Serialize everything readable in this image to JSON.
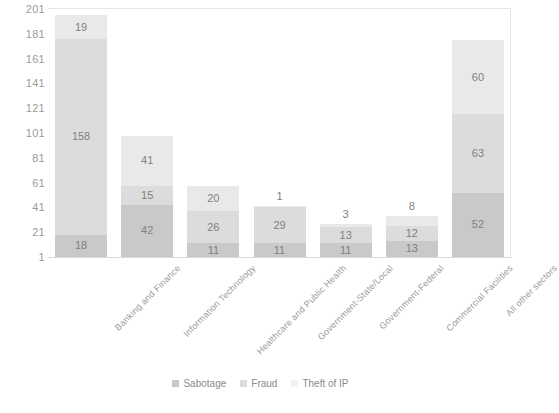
{
  "chart_data": {
    "type": "bar",
    "subtype": "stacked-bar",
    "title": "",
    "xlabel": "",
    "ylabel": "",
    "ylim": [
      1,
      201
    ],
    "ytick_step": 20,
    "yticks": [
      201,
      181,
      161,
      141,
      121,
      101,
      81,
      61,
      41,
      21,
      1
    ],
    "grid": false,
    "legend_position": "bottom",
    "categories": [
      "Banking and Finance",
      "Information Technology",
      "Healthcare and Public Health",
      "Government-State/Local",
      "Government-Federal",
      "Commercial Facilities",
      "All other sectors"
    ],
    "series": [
      {
        "name": "Sabotage",
        "color": "#c9c9c9",
        "values": [
          18,
          42,
          11,
          11,
          11,
          13,
          52
        ]
      },
      {
        "name": "Fraud",
        "color": "#dcdcdc",
        "values": [
          158,
          15,
          26,
          29,
          13,
          12,
          63
        ]
      },
      {
        "name": "Theft of IP",
        "color": "#f2f2f2",
        "values": [
          19,
          41,
          20,
          1,
          3,
          8,
          60
        ]
      }
    ]
  },
  "legend": {
    "items": [
      {
        "label": "Sabotage",
        "swatch": "sabotage-swatch"
      },
      {
        "label": "Fraud",
        "swatch": "fraud-swatch"
      },
      {
        "label": "Theft of IP",
        "swatch": "theft-of-ip-swatch"
      }
    ]
  },
  "colors": {
    "sabotage": "#c9c9c9",
    "fraud": "#dcdcdc",
    "theft_of_ip": "#f2f2f2",
    "axis_text": "#9b9b9b",
    "plot_border": "#e6e6e6",
    "background": "#ffffff"
  }
}
